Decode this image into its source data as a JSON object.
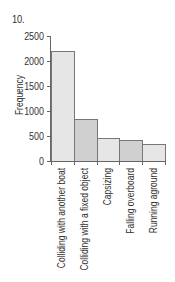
{
  "figure": {
    "number": "10."
  },
  "chart_data": {
    "type": "bar",
    "title": "",
    "xlabel": "",
    "ylabel": "Frequency",
    "categories": [
      "Colliding with another boat",
      "Colliding with a fixed object",
      "Capsizing",
      "Falling overboard",
      "Running aground"
    ],
    "values": [
      2200,
      840,
      470,
      430,
      350
    ],
    "ylim": [
      0,
      2500
    ],
    "yticks": [
      "0",
      "500",
      "1000",
      "1500",
      "2000",
      "2500"
    ],
    "grid": false,
    "legend": null,
    "bar_colors": [
      "#e6e6e6",
      "#d0d0d0",
      "#e6e6e6",
      "#d0d0d0",
      "#e6e6e6"
    ]
  }
}
